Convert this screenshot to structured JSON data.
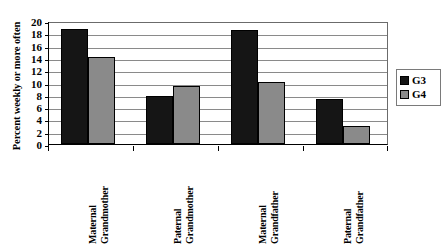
{
  "chart_data": {
    "type": "bar",
    "title": "",
    "xlabel": "",
    "ylabel": "Percent weekly or more often",
    "ylim": [
      0,
      20
    ],
    "ytick_step": 2,
    "yticks": [
      20,
      18,
      16,
      14,
      12,
      10,
      8,
      6,
      4,
      2,
      0
    ],
    "grid": true,
    "legend_position": "right",
    "categories": [
      "Maternal Grandmother",
      "Paternal Grandmother",
      "Maternal Grandfather",
      "Paternal Grandfather"
    ],
    "category_lines": [
      [
        "Maternal",
        "Grandmother"
      ],
      [
        "Paternal",
        "Grandmother"
      ],
      [
        "Maternal",
        "Grandfather"
      ],
      [
        "Paternal",
        "Grandfather"
      ]
    ],
    "series": [
      {
        "name": "G3",
        "color": "#151515",
        "values": [
          18.7,
          7.8,
          18.6,
          7.3
        ]
      },
      {
        "name": "G4",
        "color": "#8a8a8a",
        "values": [
          14.2,
          9.5,
          10.1,
          3.0
        ]
      }
    ]
  },
  "colors": {
    "g3": "#151515",
    "g4": "#8a8a8a",
    "grid": "#8a8a8a",
    "axis": "#000000",
    "background": "#ffffff"
  },
  "legend": {
    "entries": [
      {
        "label": "G3",
        "swatch": "g3"
      },
      {
        "label": "G4",
        "swatch": "g4"
      }
    ]
  }
}
